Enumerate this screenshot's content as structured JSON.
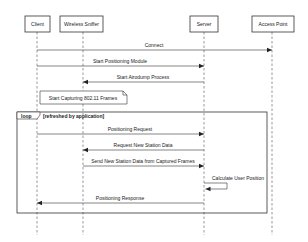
{
  "participants": [
    {
      "name": "Client",
      "x": 37,
      "box_x": 25,
      "box_w": 25
    },
    {
      "name": "Wireless Sniffer",
      "x": 83,
      "box_x": 60,
      "box_w": 43
    },
    {
      "name": "Server",
      "x": 204,
      "box_x": 190,
      "box_w": 28
    },
    {
      "name": "Access Point",
      "x": 272,
      "box_x": 252,
      "box_w": 42
    }
  ],
  "messages": [
    {
      "label": "Connect",
      "from": 0,
      "to": 3,
      "y": 50
    },
    {
      "label": "Start Positioning Module",
      "from": 0,
      "to": 2,
      "y": 66
    },
    {
      "label": "Start Airodump Process",
      "from": 2,
      "to": 1,
      "y": 82
    },
    {
      "label": "Positioning Request",
      "from": 0,
      "to": 2,
      "y": 134
    },
    {
      "label": "Request New Station Data",
      "from": 2,
      "to": 1,
      "y": 150
    },
    {
      "label": "Send New Station Data from Captured Frames",
      "from": 1,
      "to": 2,
      "y": 166
    },
    {
      "label": "Positioning Response",
      "from": 2,
      "to": 0,
      "y": 203
    }
  ],
  "self_call": {
    "label": "Calculate User Position",
    "participant": 2,
    "y1": 183,
    "y2": 189
  },
  "note": {
    "text": "Start Capturing 802.11 Frames"
  },
  "loop": {
    "keyword": "loop",
    "guard": "[refreshed by application]"
  },
  "colors": {
    "line": "#333333",
    "background": "#ffffff"
  }
}
